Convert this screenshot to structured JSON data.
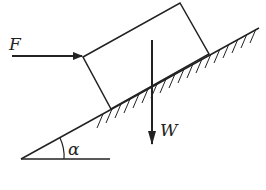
{
  "diagram": {
    "type": "free-body force diagram on inclined plane",
    "labels": {
      "force_applied": "F",
      "weight": "W",
      "angle": "α"
    },
    "elements": [
      "inclined plane with hatching",
      "rectangular block",
      "horizontal force F",
      "vertical weight W",
      "incline angle α"
    ],
    "colors": {
      "stroke": "#222222",
      "background": "#ffffff"
    }
  }
}
